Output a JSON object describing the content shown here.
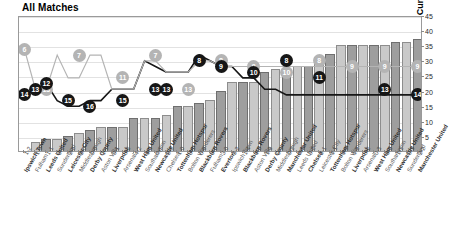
{
  "chart_data": {
    "type": "bar",
    "title": "All Matches",
    "xlabel": "",
    "ylabel": "Cumulative Points",
    "ylim": [
      0,
      45
    ],
    "ytick_step": 5,
    "yticks": [
      5,
      10,
      15,
      20,
      25,
      30,
      35,
      40,
      45
    ],
    "grid": true,
    "legend_position": "none",
    "categories": [
      "Ipswich Town",
      "Fulham",
      "Leeds United",
      "Sunderland",
      "Leicester City",
      "Middlesbrough",
      "Derby County",
      "Aston Villa",
      "Liverpool",
      "Arsenal",
      "West Ham United",
      "Southampton",
      "Newcastle United",
      "Chelsea",
      "Tottenham Hotspur",
      "Bolton Wanderers",
      "Blackburn Rovers",
      "Fulham",
      "Everton",
      "Ipswich Town",
      "Blackburn Rovers",
      "Aston Villa",
      "Derby County",
      "Middlesbrough",
      "Manchester United",
      "Leeds United",
      "Chelsea",
      "Leicester City",
      "Tottenham Hotspur",
      "Bolton Wanderers",
      "Liverpool",
      "Arsenal",
      "West Ham United",
      "Southampton",
      "Newcastle United",
      "Sunderland",
      "Manchester United"
    ],
    "scores": [
      "1-2",
      "1-0",
      "1-1",
      "0-2",
      "2-2",
      "2-0",
      "0-0",
      "1-1",
      "0-1",
      "0-3",
      "4-2",
      "1-4",
      "0-1",
      "2-2",
      "1-0",
      "0-1",
      "0-0",
      "0-0",
      "3-0",
      "3-2",
      "1-4",
      "1-2",
      "1-0",
      "0-0",
      "0-2",
      "0-0",
      "0-2",
      "2-1",
      "1-1",
      "1-0",
      "1-2",
      "0-2",
      "0-3",
      "0-2",
      "1-1",
      "0-3",
      "2-2"
    ],
    "series": [
      {
        "name": "Cumulative Points",
        "type": "bar",
        "values": [
          0,
          3,
          4,
          4,
          5,
          6,
          7,
          8,
          8,
          8,
          11,
          11,
          11,
          12,
          15,
          15,
          16,
          17,
          20,
          23,
          23,
          23,
          26,
          27,
          27,
          28,
          28,
          31,
          32,
          35,
          35,
          35,
          35,
          35,
          36,
          36,
          37
        ]
      },
      {
        "name": "League Position",
        "type": "line",
        "color": "#161616",
        "values": [
          14,
          13,
          12,
          15,
          16,
          16,
          15,
          15,
          13,
          13,
          13,
          8,
          9,
          10,
          10,
          10,
          7,
          8,
          9,
          9,
          11,
          11,
          13,
          13,
          14,
          14,
          14,
          14,
          14,
          14,
          14,
          14,
          14,
          14,
          14,
          14,
          14
        ]
      },
      {
        "name": "Opponent Position",
        "type": "line",
        "color": "#b4b4b4",
        "values": [
          6,
          13,
          13,
          7,
          11,
          11,
          7,
          7,
          13,
          13,
          13,
          8,
          8,
          10,
          10,
          10,
          8,
          8,
          9,
          9,
          9,
          9,
          9,
          9,
          9,
          9,
          9,
          9,
          9,
          9,
          9,
          9,
          9,
          9,
          9,
          9,
          9
        ]
      }
    ],
    "point_labels_black": [
      {
        "i": 0,
        "v": 14
      },
      {
        "i": 1,
        "v": 13
      },
      {
        "i": 2,
        "v": 12
      },
      {
        "i": 4,
        "v": 15
      },
      {
        "i": 6,
        "v": 16
      },
      {
        "i": 9,
        "v": 15
      },
      {
        "i": 12,
        "v": 13
      },
      {
        "i": 13,
        "v": 13
      },
      {
        "i": 16,
        "v": 8
      },
      {
        "i": 18,
        "v": 9
      },
      {
        "i": 21,
        "v": 10
      },
      {
        "i": 24,
        "v": 8
      },
      {
        "i": 27,
        "v": 11
      },
      {
        "i": 33,
        "v": 13
      },
      {
        "i": 36,
        "v": 14
      }
    ],
    "point_labels_gray": [
      {
        "i": 0,
        "v": 6
      },
      {
        "i": 2,
        "v": 13
      },
      {
        "i": 5,
        "v": 7
      },
      {
        "i": 9,
        "v": 11
      },
      {
        "i": 12,
        "v": 7
      },
      {
        "i": 15,
        "v": 13
      },
      {
        "i": 18,
        "v": 8
      },
      {
        "i": 21,
        "v": 9
      },
      {
        "i": 24,
        "v": 10
      },
      {
        "i": 27,
        "v": 8
      },
      {
        "i": 30,
        "v": 9
      },
      {
        "i": 33,
        "v": 9
      },
      {
        "i": 36,
        "v": 9
      }
    ]
  }
}
